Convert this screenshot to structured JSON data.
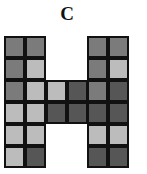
{
  "title": "C",
  "colors": {
    "mid": "#7b7b7b",
    "light": "#bcbcbc",
    "dark": "#565656"
  },
  "grid": {
    "rows": [
      [
        "mid",
        "mid",
        null,
        null,
        "mid",
        "mid"
      ],
      [
        "mid",
        "light",
        null,
        null,
        "mid",
        "light"
      ],
      [
        "mid",
        "light",
        "light",
        "dark",
        "mid",
        "dark"
      ],
      [
        "light",
        "light",
        "dark",
        "dark",
        "dark",
        "dark"
      ],
      [
        "light",
        "light",
        null,
        null,
        "light",
        "light"
      ],
      [
        "light",
        "dark",
        null,
        null,
        "dark",
        "dark"
      ]
    ]
  }
}
